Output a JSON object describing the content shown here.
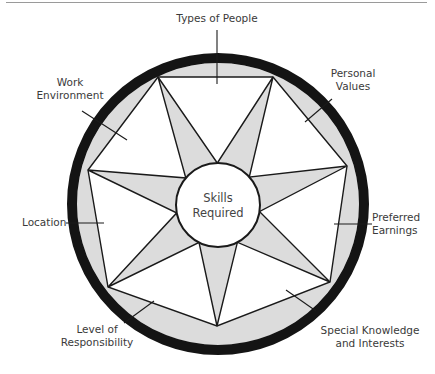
{
  "diagram": {
    "center_label": [
      "Skills",
      "Required"
    ],
    "colors": {
      "ring": "#141414",
      "shade": "#dcdcdc",
      "line": "#1a1a1a",
      "text": "#3a3a3a",
      "rule": "#9a9a9a"
    },
    "points": [
      {
        "id": "types-of-people",
        "label": [
          "Types of People"
        ]
      },
      {
        "id": "personal-values",
        "label": [
          "Personal",
          "Values"
        ]
      },
      {
        "id": "preferred-earnings",
        "label": [
          "Preferred",
          "Earnings"
        ]
      },
      {
        "id": "special-knowledge",
        "label": [
          "Special Knowledge",
          "and Interests"
        ]
      },
      {
        "id": "level-of-responsibility",
        "label": [
          "Level of",
          "Responsibility"
        ]
      },
      {
        "id": "location",
        "label": [
          "Location"
        ]
      },
      {
        "id": "work-environment",
        "label": [
          "Work",
          "Environment"
        ]
      }
    ]
  }
}
